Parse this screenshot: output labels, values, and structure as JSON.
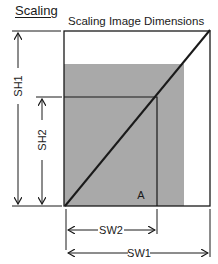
{
  "heading": "Scaling",
  "diagram": {
    "title": "Scaling Image Dimensions",
    "labels": {
      "sh1": "SH1",
      "sh2": "SH2",
      "sw1": "SW1",
      "sw2": "SW2",
      "a": "A"
    },
    "colors": {
      "shaded_area": "#a9a9a9",
      "lines": "#1a1a1a",
      "background": "#ffffff"
    }
  }
}
